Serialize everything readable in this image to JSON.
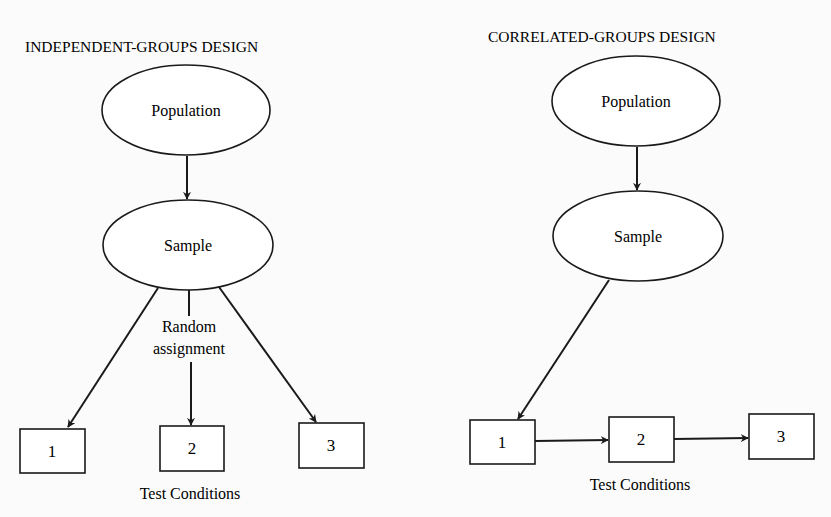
{
  "left_panel": {
    "title": "INDEPENDENT-GROUPS DESIGN",
    "population_label": "Population",
    "sample_label": "Sample",
    "assignment_label_line1": "Random",
    "assignment_label_line2": "assignment",
    "conditions": [
      "1",
      "2",
      "3"
    ],
    "conditions_caption": "Test Conditions"
  },
  "right_panel": {
    "title": "CORRELATED-GROUPS DESIGN",
    "population_label": "Population",
    "sample_label": "Sample",
    "conditions": [
      "1",
      "2",
      "3"
    ],
    "conditions_caption": "Test Conditions"
  },
  "colors": {
    "stroke": "#1a1a1a",
    "background": "#fbfbfb",
    "fill": "#ffffff"
  }
}
